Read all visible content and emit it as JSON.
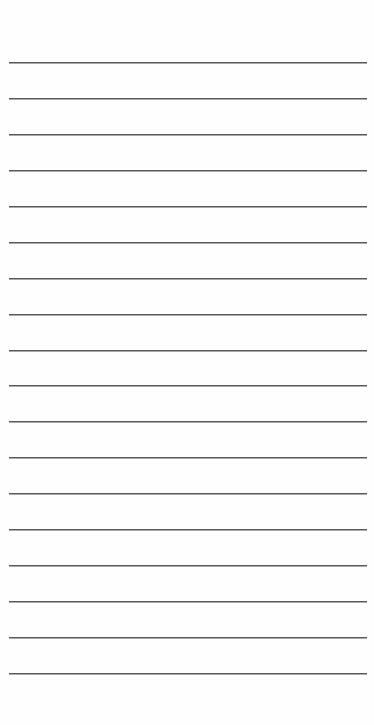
{
  "page": {
    "type": "lined-paper",
    "background_color": "#fefefe",
    "line_color": "#5a5a5a",
    "line_count": 18,
    "first_line_y": 62,
    "line_spacing": 35.94,
    "line_left": 9,
    "line_width": 358
  },
  "lines": [
    {
      "text": ""
    },
    {
      "text": ""
    },
    {
      "text": ""
    },
    {
      "text": ""
    },
    {
      "text": ""
    },
    {
      "text": ""
    },
    {
      "text": ""
    },
    {
      "text": ""
    },
    {
      "text": ""
    },
    {
      "text": ""
    },
    {
      "text": ""
    },
    {
      "text": ""
    },
    {
      "text": ""
    },
    {
      "text": ""
    },
    {
      "text": ""
    },
    {
      "text": ""
    },
    {
      "text": ""
    },
    {
      "text": ""
    }
  ]
}
